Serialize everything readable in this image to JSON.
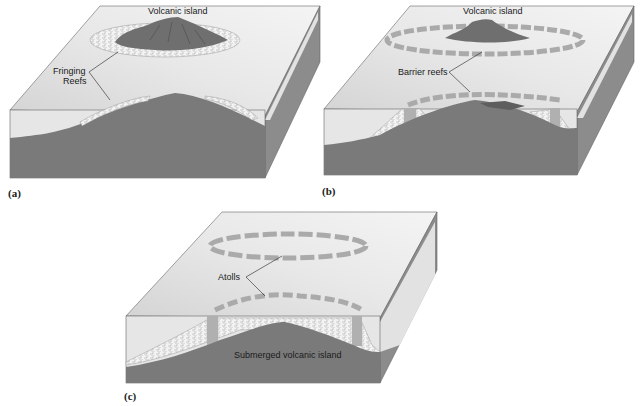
{
  "figure": {
    "panels": [
      {
        "id": "a",
        "caption": "(a)",
        "labels": {
          "top": "Volcanic island",
          "reef_line1": "Fringing",
          "reef_line2": "Reefs"
        }
      },
      {
        "id": "b",
        "caption": "(b)",
        "labels": {
          "top": "Volcanic island",
          "reef": "Barrier reefs"
        }
      },
      {
        "id": "c",
        "caption": "(c)",
        "labels": {
          "reef": "Atolls",
          "bottom": "Submerged volcanic island"
        }
      }
    ]
  },
  "colors": {
    "top_face_light": "#f2f2f2",
    "top_face_dark": "#d8d8d8",
    "water_front": "#e6e6e6",
    "rock": "#7b7b7b",
    "right_face": "#8e8e8e",
    "island": "#6f6f6f",
    "reef": "#f0f0f0"
  }
}
